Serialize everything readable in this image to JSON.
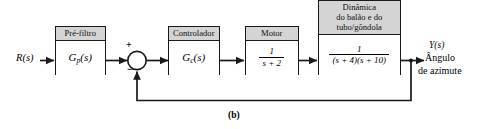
{
  "figure": {
    "caption": "(b)",
    "background": "#ffffff",
    "line_color": "#1a1a1a",
    "header_fill": "#d4d4d4"
  },
  "signals": {
    "input_label": "R(s)",
    "output_label": "Y(s)",
    "output_desc_line1": "Ângulo",
    "output_desc_line2": "de azimute"
  },
  "summing_junction": {
    "name": "summing-junction",
    "plus": "+",
    "minus": "−"
  },
  "blocks": [
    {
      "id": "prefilter",
      "header": "Pré-filtro",
      "tf_type": "symbol",
      "tf": "G",
      "tf_sub": "p",
      "tf_arg": "(s)"
    },
    {
      "id": "controller",
      "header": "Controlador",
      "tf_type": "symbol",
      "tf": "G",
      "tf_sub": "c",
      "tf_arg": "(s)"
    },
    {
      "id": "motor",
      "header": "Motor",
      "tf_type": "fraction",
      "numerator": "1",
      "denominator": "s + 2"
    },
    {
      "id": "balloon-dynamics",
      "header": "Dinâmica\ndo balão e do\ntubo/gôndola",
      "tf_type": "fraction",
      "numerator": "1",
      "denominator": "(s + 4)(s + 10)"
    }
  ]
}
